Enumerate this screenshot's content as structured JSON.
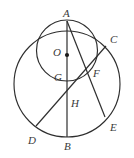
{
  "figure": {
    "kind": "geometry-diagram",
    "width": 134,
    "height": 158,
    "background": "#ffffff",
    "stroke_color": "#2e2e2e",
    "label_color": "#3a3a3a"
  },
  "labels": {
    "A": "A",
    "B": "B",
    "C": "C",
    "D": "D",
    "E": "E",
    "F": "F",
    "G": "G",
    "H": "H",
    "O": "O"
  },
  "label_positions": {
    "A": {
      "x": 63,
      "y": 8
    },
    "B": {
      "x": 64,
      "y": 141
    },
    "C": {
      "x": 110,
      "y": 34
    },
    "D": {
      "x": 28,
      "y": 135
    },
    "E": {
      "x": 110,
      "y": 122
    },
    "F": {
      "x": 93,
      "y": 68
    },
    "G": {
      "x": 54,
      "y": 72
    },
    "H": {
      "x": 71,
      "y": 98
    },
    "O": {
      "x": 53,
      "y": 47
    }
  },
  "geometry": {
    "big_circle": {
      "cx": 67,
      "cy": 84,
      "r": 53
    },
    "small_circle": {
      "cx": 67,
      "cy": 50.5,
      "r": 30.5
    },
    "center_dot": {
      "cx": 67,
      "cy": 55,
      "r": 2.1
    },
    "points": {
      "A": {
        "x": 67,
        "y": 21
      },
      "B": {
        "x": 67,
        "y": 137
      },
      "C": {
        "x": 106,
        "y": 46
      },
      "D": {
        "x": 36,
        "y": 126
      },
      "E": {
        "x": 105,
        "y": 117
      },
      "F": {
        "x": 88,
        "y": 76
      },
      "G": {
        "x": 67,
        "y": 81
      },
      "H": {
        "x": 67,
        "y": 103
      },
      "O": {
        "x": 67,
        "y": 55
      }
    },
    "segments": [
      {
        "name": "segment-AB",
        "from": "A",
        "to": "B"
      },
      {
        "name": "segment-AE",
        "from": "A",
        "to": "E"
      },
      {
        "name": "segment-DC",
        "from": "D",
        "to": "C"
      }
    ]
  }
}
